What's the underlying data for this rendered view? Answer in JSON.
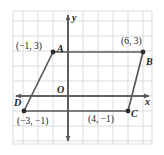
{
  "figure": {
    "type": "coordinate-plane-parallelogram",
    "background_color": "#ffffff",
    "grid_color": "#d8dde0",
    "axis_color": "#58595b",
    "shape_color": "#58595b",
    "plot_box": {
      "left": 13,
      "top": 11,
      "right": 152,
      "bottom": 144
    },
    "grid_spacing_px": 15,
    "origin_px": {
      "x": 68,
      "y": 96
    },
    "axes": {
      "x_label": "x",
      "y_label": "y",
      "origin_label": "O"
    },
    "vertices": [
      {
        "name": "A",
        "coord_label": "(−1, 3)",
        "x": -1,
        "y": 3,
        "px": 53,
        "py": 52,
        "label_pos": "right",
        "coord_pos": "left"
      },
      {
        "name": "B",
        "coord_label": "(6, 3)",
        "x": 6,
        "y": 3,
        "px": 143,
        "py": 52,
        "label_pos": "below-right",
        "coord_pos": "above-left"
      },
      {
        "name": "C",
        "coord_label": "(4, −1)",
        "x": 4,
        "y": -1,
        "px": 128,
        "py": 111,
        "label_pos": "right",
        "coord_pos": "left"
      },
      {
        "name": "D",
        "coord_label": "(−3, −1)",
        "x": -3,
        "y": -1,
        "px": 24,
        "py": 111,
        "label_pos": "above-left",
        "coord_pos": "below"
      }
    ],
    "edges": [
      {
        "from": "A",
        "to": "B"
      },
      {
        "from": "B",
        "to": "C"
      },
      {
        "from": "C",
        "to": "D"
      },
      {
        "from": "D",
        "to": "A"
      }
    ]
  }
}
